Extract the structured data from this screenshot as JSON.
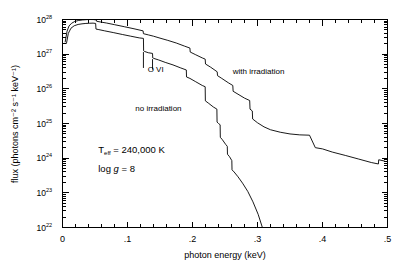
{
  "chart_data": {
    "type": "line",
    "title": "",
    "xlabel": "photon energy (keV)",
    "ylabel": "flux (photons cm⁻² s⁻¹ keV⁻¹)",
    "xlim": [
      0,
      0.5
    ],
    "ylim": [
      1e+22,
      1e+28
    ],
    "yscale": "log",
    "xscale": "linear",
    "grid": false,
    "legend_position": "inline-annotations",
    "xticklabels": [
      "0",
      ".1",
      ".2",
      ".3",
      ".4",
      ".5"
    ],
    "xtickvalues": [
      0,
      0.1,
      0.2,
      0.3,
      0.4,
      0.5
    ],
    "yticklabels": [
      "10^22",
      "10^23",
      "10^24",
      "10^25",
      "10^26",
      "10^27",
      "10^28"
    ],
    "ytickvalues": [
      1e+22,
      1e+23,
      1e+24,
      1e+25,
      1e+26,
      1e+27,
      1e+28
    ],
    "ytickmantissas": [
      "10",
      "10",
      "10",
      "10",
      "10",
      "10",
      "10"
    ],
    "ytickexponents": [
      "22",
      "23",
      "24",
      "25",
      "26",
      "27",
      "28"
    ],
    "series": [
      {
        "name": "with irradiation",
        "x": [
          0.004,
          0.007,
          0.01,
          0.014,
          0.019,
          0.025,
          0.031,
          0.037,
          0.043,
          0.048,
          0.052,
          0.0525,
          0.058,
          0.068,
          0.08,
          0.095,
          0.11,
          0.124,
          0.1245,
          0.132,
          0.14,
          0.15,
          0.162,
          0.175,
          0.188,
          0.196,
          0.1965,
          0.205,
          0.215,
          0.2195,
          0.22,
          0.228,
          0.238,
          0.2385,
          0.245,
          0.255,
          0.262,
          0.2625,
          0.27,
          0.28,
          0.288,
          0.2885,
          0.292,
          0.2925,
          0.3,
          0.31,
          0.32,
          0.335,
          0.35,
          0.365,
          0.38,
          0.389,
          0.3895,
          0.4,
          0.415,
          0.435,
          0.455,
          0.475,
          0.486,
          0.4865,
          0.496
        ],
        "y": [
          2.2e+27,
          4.6e+27,
          6.5e+27,
          7.8e+27,
          8.8e+27,
          9.4e+27,
          9.7e+27,
          9.9e+27,
          1e+28,
          9.95e+27,
          9.7e+27,
          8.9e+27,
          8.5e+27,
          7.9e+27,
          7.1e+27,
          6.2e+27,
          5.4e+27,
          4.7e+27,
          3.9e+27,
          3.6e+27,
          3.3e+27,
          2.9e+27,
          2.5e+27,
          2.1e+27,
          1.7e+27,
          1.5e+27,
          1.15e+27,
          9.6e+26,
          7.8e+26,
          7.2e+26,
          5.2e+26,
          4.2e+26,
          3.1e+26,
          2.4e+26,
          2e+26,
          1.5e+26,
          1.25e+26,
          8.5e+25,
          7e+25,
          5.4e+25,
          4.6e+25,
          2.6e+25,
          2.3e+25,
          1.35e+25,
          1.05e+25,
          8e+24,
          6.6e+24,
          5.6e+24,
          5e+24,
          4.7e+24,
          4.6e+24,
          2e+24,
          2e+24,
          1.85e+24,
          1.5e+24,
          1.2e+24,
          9.5e+23,
          7.5e+23,
          6.8e+23,
          9e+23,
          8.2e+23
        ]
      },
      {
        "name": "no irradiation",
        "x": [
          0.006,
          0.009,
          0.013,
          0.018,
          0.024,
          0.03,
          0.036,
          0.042,
          0.047,
          0.051,
          0.0515,
          0.056,
          0.065,
          0.078,
          0.092,
          0.105,
          0.118,
          0.1245,
          0.1248,
          0.126,
          0.132,
          0.1385,
          0.1388,
          0.14,
          0.148,
          0.158,
          0.17,
          0.182,
          0.1905,
          0.1908,
          0.196,
          0.205,
          0.215,
          0.2195,
          0.2198,
          0.225,
          0.232,
          0.2375,
          0.2378,
          0.24,
          0.2425,
          0.2428,
          0.246,
          0.251,
          0.2535,
          0.2538,
          0.257,
          0.2605,
          0.2608,
          0.264,
          0.27,
          0.277,
          0.285,
          0.293,
          0.301,
          0.3075
        ],
        "y": [
          2e+27,
          4e+27,
          5.6e+27,
          6.6e+27,
          7.2e+27,
          7.5e+27,
          7.7e+27,
          7.8e+27,
          7.85e+27,
          7.7e+27,
          5.3e+27,
          5.1e+27,
          4.7e+27,
          4.2e+27,
          3.7e+27,
          3.3e+27,
          2.95e+27,
          2.85e+27,
          1.25e+27,
          1.2e+27,
          1.1e+27,
          1.05e+27,
          7.8e+26,
          7.6e+26,
          6.8e+26,
          5.8e+26,
          4.9e+26,
          4e+26,
          3.5e+26,
          2.2e+26,
          2e+26,
          1.6e+26,
          1.25e+26,
          1.15e+26,
          4.5e+25,
          3.8e+25,
          3e+25,
          2.6e+25,
          1.1e+25,
          1e+25,
          9.2e+24,
          4e+24,
          3.4e+24,
          2.5e+24,
          2.2e+24,
          1.3e+24,
          1.1e+24,
          8.5e+23,
          4.6e+23,
          4e+23,
          2.9e+23,
          1.9e+23,
          1.1e+23,
          5.5e+22,
          2.4e+22,
          1e+22
        ]
      }
    ],
    "annotations": [
      {
        "name": "ovi-label",
        "text": "O VI",
        "x": 0.131,
        "y": 3.1e+26
      },
      {
        "name": "with-irradiation-label",
        "text": "with irradiation",
        "x": 0.262,
        "y": 2.6e+26
      },
      {
        "name": "no-irradiation-label",
        "text": "no irradiation",
        "x": 0.112,
        "y": 2.3e+25
      },
      {
        "name": "teff-label",
        "text": "T",
        "sub": "eff",
        "rest": " =  240,000 K",
        "x": 0.055,
        "y": 1.4e+24
      },
      {
        "name": "logg-label",
        "text": "log ",
        "ital": "g",
        "rest": " =  8",
        "x": 0.055,
        "y": 4e+23
      }
    ],
    "ovi_markers": [
      {
        "x": 0.1245,
        "y_top": 1.15e+27,
        "y_bottom": 4e+26
      },
      {
        "x": 0.1385,
        "y_top": 7.2e+26,
        "y_bottom": 3.6e+26
      }
    ]
  },
  "labels": {
    "teff_symbol": "T",
    "teff_sub": "eff",
    "teff_value": " =  240,000 K",
    "logg_prefix": "log ",
    "logg_symbol": "g",
    "logg_value": " =  8",
    "ovi": "O VI",
    "with_irradiation": "with irradiation",
    "no_irradiation": "no irradiation"
  },
  "colors": {
    "background": "#ffffff",
    "axis": "#000000",
    "curve": "#000000"
  }
}
